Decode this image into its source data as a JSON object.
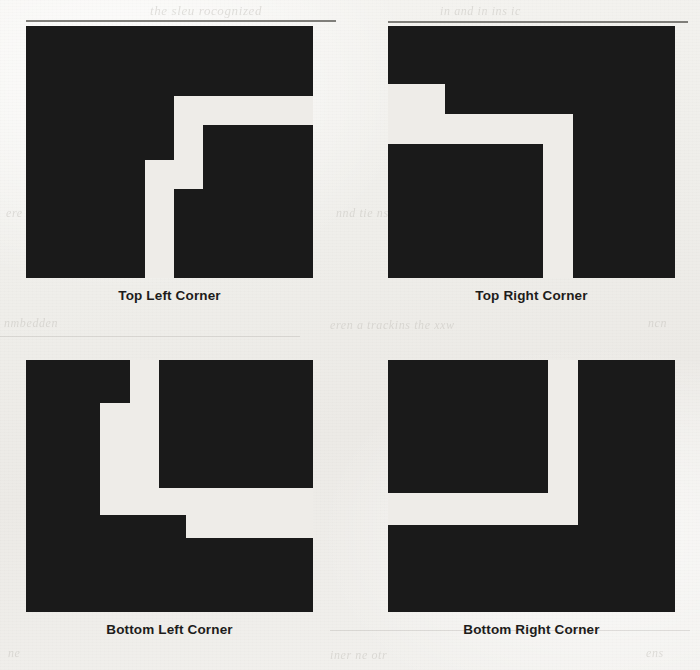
{
  "figure": {
    "background_color": "#efeeea",
    "ink_color": "#1a1a1a",
    "panel_count": 4,
    "panels": [
      {
        "id": "top-left",
        "caption": "Top Left Corner",
        "icon_name": "corner-pattern-top-left",
        "description": "Solid black square with a white staircase channel cut inward from the lower-right"
      },
      {
        "id": "top-right",
        "caption": "Top Right Corner",
        "icon_name": "corner-pattern-top-right",
        "description": "Solid black square with a white staircase channel entering from the left edge and descending to the bottom edge"
      },
      {
        "id": "bottom-left",
        "caption": "Bottom Left Corner",
        "icon_name": "corner-pattern-bottom-left",
        "description": "Solid black square with a white staircase channel entering from the top edge and exiting through the right edge"
      },
      {
        "id": "bottom-right",
        "caption": "Bottom Right Corner",
        "icon_name": "corner-pattern-bottom-right",
        "description": "Solid black square with a plain L-shaped white channel separating an upper-left block from the right and lower bands"
      }
    ]
  },
  "bleed_text": {
    "line_top_center": "the  sleu  rocognized",
    "line_top_right": "in and  in  ins ic",
    "line_mid_left": "nmbedden",
    "line_mid_center": "eren  a  trackins  the  xxw",
    "line_mid_right": "ncn",
    "line_low_left": "ere",
    "line_low_center": "nnd  tie  nsters",
    "line_bottom_left": "ne",
    "line_bottom_center": "iner  ne  otr",
    "line_bottom_right": "ens"
  }
}
